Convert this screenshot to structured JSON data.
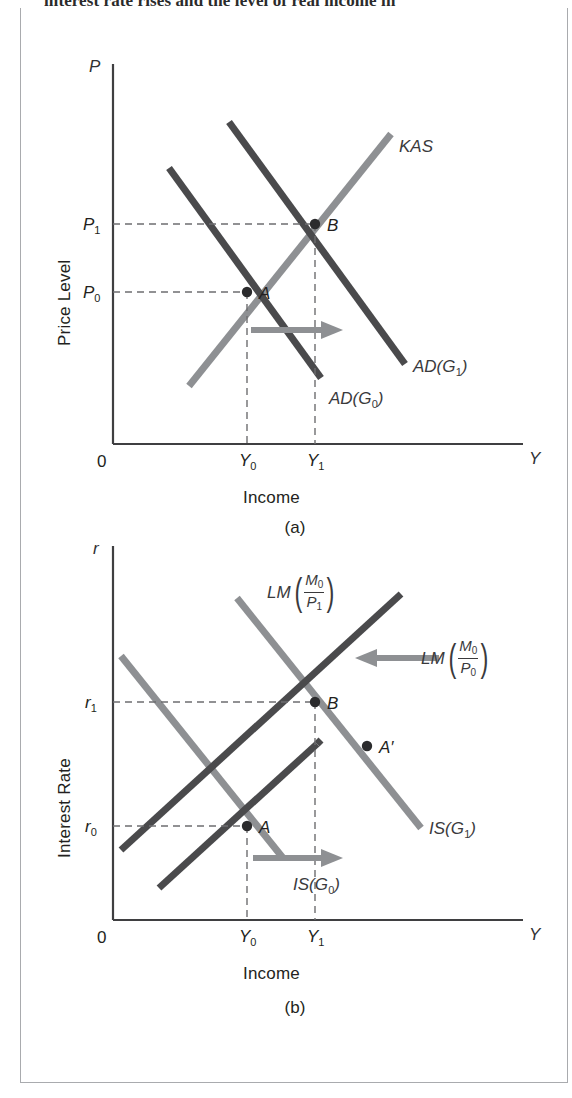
{
  "page": {
    "clipped_running_text": "interest rate rises and the level of real income in",
    "border_color": "#a9abae"
  },
  "colors": {
    "dark_curve": "#4a4a4c",
    "light_curve": "#8e9093",
    "axis": "#3f3f41",
    "dashed": "#6e6e70",
    "arrow_a": "#8e9093",
    "arrow_b_left": "#8e9093",
    "arrow_b_right": "#8e9093",
    "point_dot": "#2b2b2d",
    "text": "#231f20"
  },
  "panel_a": {
    "caption": "(a)",
    "y_axis_symbol": "P",
    "y_axis_title": "Price Level",
    "x_axis_symbol": "Y",
    "x_axis_title": "Income",
    "origin_label": "0",
    "y_ticks": [
      {
        "base": "P",
        "sub": "1"
      },
      {
        "base": "P",
        "sub": "0"
      }
    ],
    "x_ticks": [
      {
        "base": "Y",
        "sub": "0"
      },
      {
        "base": "Y",
        "sub": "1"
      }
    ],
    "curves": [
      {
        "name": "KAS",
        "base": "KAS",
        "sub": "",
        "paren": false,
        "color": "light",
        "slope": "up"
      },
      {
        "name": "AD(G1)",
        "base": "AD(G",
        "sub": "1",
        "tail": ")",
        "paren": true,
        "color": "dark",
        "slope": "down"
      },
      {
        "name": "AD(G0)",
        "base": "AD(G",
        "sub": "0",
        "tail": ")",
        "paren": true,
        "color": "dark",
        "slope": "down"
      }
    ],
    "points": [
      {
        "label": "A",
        "x_tick": "Y0",
        "y_tick": "P0"
      },
      {
        "label": "B",
        "x_tick": "Y1",
        "y_tick": "P1"
      }
    ],
    "shift_arrow": {
      "direction": "right",
      "meaning": "AD shifts right"
    }
  },
  "panel_b": {
    "caption": "(b)",
    "y_axis_symbol": "r",
    "y_axis_title": "Interest Rate",
    "x_axis_symbol": "Y",
    "x_axis_title": "Income",
    "origin_label": "0",
    "y_ticks": [
      {
        "base": "r",
        "sub": "1"
      },
      {
        "base": "r",
        "sub": "0"
      }
    ],
    "x_ticks": [
      {
        "base": "Y",
        "sub": "0"
      },
      {
        "base": "Y",
        "sub": "1"
      }
    ],
    "curves": [
      {
        "name": "LM(M0/P1)",
        "prefix": "LM",
        "num_base": "M",
        "num_sub": "0",
        "den_base": "P",
        "den_sub": "1",
        "fraction": true,
        "color": "dark",
        "slope": "up"
      },
      {
        "name": "LM(M0/P0)",
        "prefix": "LM",
        "num_base": "M",
        "num_sub": "0",
        "den_base": "P",
        "den_sub": "0",
        "fraction": true,
        "color": "dark",
        "slope": "up"
      },
      {
        "name": "IS(G1)",
        "base": "IS(G",
        "sub": "1",
        "tail": ")",
        "fraction": false,
        "color": "light",
        "slope": "down"
      },
      {
        "name": "IS(G0)",
        "base": "IS(G",
        "sub": "0",
        "tail": ")",
        "fraction": false,
        "color": "light",
        "slope": "down"
      }
    ],
    "points": [
      {
        "label": "A",
        "x_tick": "Y0",
        "y_tick": "r0"
      },
      {
        "label": "B",
        "x_tick": "Y1",
        "y_tick": "r1"
      },
      {
        "label": "A′",
        "x_tick": "",
        "y_tick": ""
      }
    ],
    "shift_arrows": [
      {
        "direction": "left",
        "meaning": "LM shifts left"
      },
      {
        "direction": "right",
        "meaning": "IS shifts right"
      }
    ]
  }
}
